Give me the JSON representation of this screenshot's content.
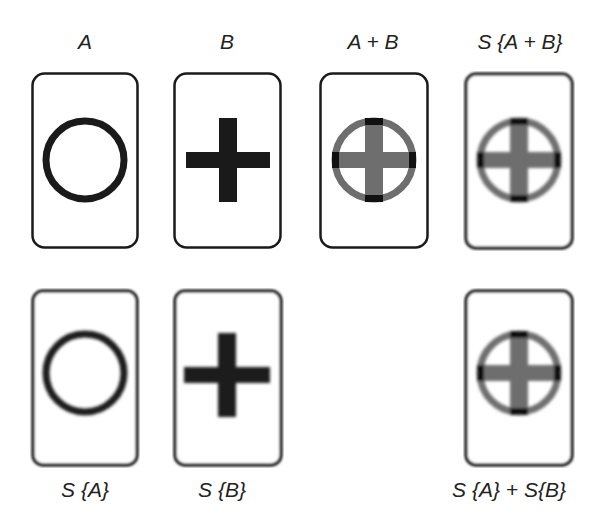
{
  "figure": {
    "top_labels": {
      "a": "A",
      "b": "B",
      "a_plus_b": "A + B",
      "s_a_plus_b": "S {A + B}"
    },
    "bottom_labels": {
      "s_a": "S {A}",
      "s_b": "S {B}",
      "s_a_plus_s_b": "S {A} + S{B}"
    },
    "panels": [
      {
        "id": "A",
        "content": "circle",
        "style": "sharp"
      },
      {
        "id": "B",
        "content": "cross",
        "style": "sharp"
      },
      {
        "id": "A+B",
        "content": "circle-with-cross",
        "style": "sharp-gray"
      },
      {
        "id": "S{A+B}",
        "content": "circle-with-cross",
        "style": "blurred"
      },
      {
        "id": "S{A}",
        "content": "circle",
        "style": "blurred"
      },
      {
        "id": "S{B}",
        "content": "cross",
        "style": "blurred"
      },
      {
        "id": "S{A}+S{B}",
        "content": "circle-with-cross",
        "style": "blurred"
      }
    ],
    "colors": {
      "stroke": "#1a1a1a",
      "sum_gray": "#6e6e6e",
      "overlap_dark": "#111111",
      "background": "#ffffff"
    }
  }
}
